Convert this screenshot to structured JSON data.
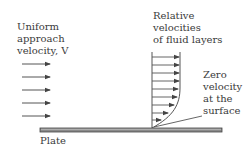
{
  "diagram": {
    "labels": {
      "approach": [
        "Uniform",
        "approach",
        "velocity, V"
      ],
      "relative": [
        "Relative",
        "velocities",
        "of fluid layers"
      ],
      "zero": [
        "Zero",
        "velocity",
        "at the",
        "surface"
      ],
      "plate": "Plate"
    },
    "approach_arrows": {
      "count": 5,
      "x_start": 22,
      "x_end": 50,
      "y": [
        64,
        77,
        90,
        103,
        116
      ]
    },
    "profile": {
      "wall_x": 152,
      "y_top": 52,
      "y_bottom": 128,
      "arrows": [
        {
          "y": 57,
          "x_end": 180
        },
        {
          "y": 65,
          "x_end": 180
        },
        {
          "y": 73,
          "x_end": 180
        },
        {
          "y": 81,
          "x_end": 180
        },
        {
          "y": 89,
          "x_end": 179
        },
        {
          "y": 97,
          "x_end": 178
        },
        {
          "y": 105,
          "x_end": 175
        },
        {
          "y": 113,
          "x_end": 169
        },
        {
          "y": 120,
          "x_end": 162
        }
      ]
    },
    "plate": {
      "x": 40,
      "y": 128,
      "width": 182,
      "height": 4
    },
    "colors": {
      "line": "#555555",
      "plate": "#8a8a8a",
      "plate_edge": "#444444",
      "text": "#3a3a3a"
    }
  }
}
